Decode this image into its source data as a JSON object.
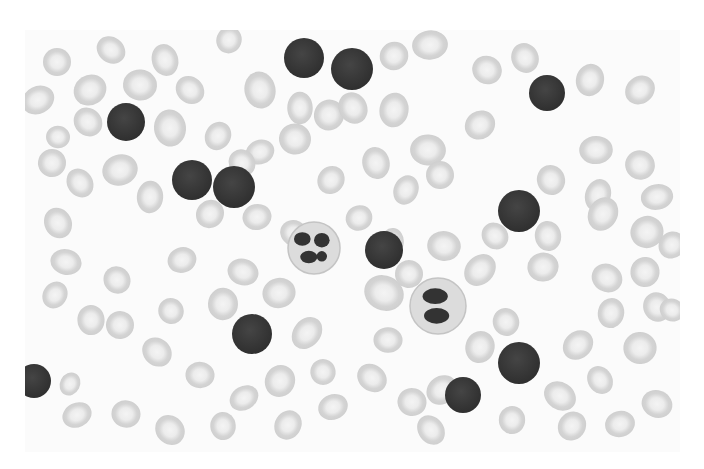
{
  "image": {
    "description": "Grayscale peripheral blood smear micrograph",
    "subject": "Blood cells: numerous small lymphocytes, two segmented neutrophils, and red blood cells",
    "field": {
      "x": 25,
      "y": 30,
      "width": 655,
      "height": 422
    },
    "colors": {
      "background": "#ffffff",
      "rbc_fill": "#d6d6d6",
      "rbc_center": "#f2f2f2",
      "lymphocyte": "#3a3a3a",
      "neutrophil_cytoplasm": "#e0e0e0",
      "neutrophil_nucleus": "#333333"
    },
    "lymphocytes": [
      {
        "cx": 304,
        "cy": 58,
        "r": 20
      },
      {
        "cx": 352,
        "cy": 69,
        "r": 21
      },
      {
        "cx": 126,
        "cy": 122,
        "r": 19
      },
      {
        "cx": 547,
        "cy": 93,
        "r": 18
      },
      {
        "cx": 192,
        "cy": 180,
        "r": 20
      },
      {
        "cx": 234,
        "cy": 187,
        "r": 21
      },
      {
        "cx": 519,
        "cy": 211,
        "r": 21
      },
      {
        "cx": 384,
        "cy": 250,
        "r": 19
      },
      {
        "cx": 252,
        "cy": 334,
        "r": 20
      },
      {
        "cx": 519,
        "cy": 363,
        "r": 21
      },
      {
        "cx": 463,
        "cy": 395,
        "r": 18
      },
      {
        "cx": 34,
        "cy": 381,
        "r": 17
      }
    ],
    "neutrophils": [
      {
        "cx": 314,
        "cy": 248,
        "r": 26
      },
      {
        "cx": 438,
        "cy": 306,
        "r": 28
      }
    ],
    "rbcs": [
      [
        57,
        62,
        14
      ],
      [
        111,
        50,
        14
      ],
      [
        165,
        60,
        14
      ],
      [
        229,
        40,
        13
      ],
      [
        90,
        90,
        15
      ],
      [
        140,
        85,
        17
      ],
      [
        190,
        90,
        14
      ],
      [
        260,
        90,
        16
      ],
      [
        329,
        115,
        15
      ],
      [
        38,
        100,
        15
      ],
      [
        58,
        137,
        12
      ],
      [
        88,
        122,
        14
      ],
      [
        170,
        128,
        16
      ],
      [
        218,
        136,
        14
      ],
      [
        260,
        152,
        13
      ],
      [
        295,
        139,
        16
      ],
      [
        242,
        163,
        13
      ],
      [
        300,
        108,
        14
      ],
      [
        331,
        180,
        14
      ],
      [
        120,
        170,
        16
      ],
      [
        52,
        163,
        14
      ],
      [
        80,
        183,
        14
      ],
      [
        150,
        197,
        14
      ],
      [
        210,
        214,
        14
      ],
      [
        257,
        217,
        13
      ],
      [
        294,
        233,
        14
      ],
      [
        353,
        108,
        15
      ],
      [
        394,
        110,
        15
      ],
      [
        394,
        56,
        14
      ],
      [
        430,
        45,
        16
      ],
      [
        487,
        70,
        15
      ],
      [
        525,
        58,
        14
      ],
      [
        590,
        80,
        14
      ],
      [
        640,
        90,
        15
      ],
      [
        596,
        150,
        15
      ],
      [
        640,
        165,
        15
      ],
      [
        551,
        180,
        14
      ],
      [
        598,
        195,
        14
      ],
      [
        480,
        125,
        15
      ],
      [
        428,
        150,
        16
      ],
      [
        440,
        175,
        14
      ],
      [
        376,
        163,
        15
      ],
      [
        406,
        190,
        13
      ],
      [
        359,
        218,
        13
      ],
      [
        444,
        246,
        15
      ],
      [
        495,
        236,
        14
      ],
      [
        548,
        236,
        14
      ],
      [
        603,
        214,
        15
      ],
      [
        647,
        232,
        16
      ],
      [
        66,
        262,
        14
      ],
      [
        117,
        280,
        14
      ],
      [
        91,
        320,
        14
      ],
      [
        55,
        295,
        12
      ],
      [
        182,
        260,
        14
      ],
      [
        243,
        272,
        14
      ],
      [
        171,
        311,
        13
      ],
      [
        223,
        304,
        15
      ],
      [
        307,
        333,
        15
      ],
      [
        279,
        293,
        16
      ],
      [
        384,
        293,
        18
      ],
      [
        409,
        274,
        14
      ],
      [
        392,
        242,
        13
      ],
      [
        480,
        270,
        15
      ],
      [
        543,
        267,
        15
      ],
      [
        607,
        278,
        14
      ],
      [
        657,
        307,
        15
      ],
      [
        611,
        313,
        14
      ],
      [
        578,
        345,
        14
      ],
      [
        640,
        348,
        16
      ],
      [
        560,
        396,
        15
      ],
      [
        506,
        322,
        14
      ],
      [
        480,
        347,
        15
      ],
      [
        442,
        390,
        14
      ],
      [
        388,
        340,
        14
      ],
      [
        372,
        378,
        14
      ],
      [
        323,
        372,
        13
      ],
      [
        280,
        381,
        15
      ],
      [
        244,
        398,
        13
      ],
      [
        200,
        375,
        14
      ],
      [
        157,
        352,
        14
      ],
      [
        120,
        325,
        14
      ],
      [
        70,
        384,
        11
      ],
      [
        77,
        415,
        13
      ],
      [
        126,
        414,
        14
      ],
      [
        170,
        430,
        14
      ],
      [
        223,
        426,
        14
      ],
      [
        288,
        425,
        14
      ],
      [
        333,
        407,
        13
      ],
      [
        412,
        402,
        14
      ],
      [
        431,
        430,
        14
      ],
      [
        512,
        420,
        14
      ],
      [
        572,
        426,
        14
      ],
      [
        620,
        424,
        13
      ],
      [
        657,
        404,
        15
      ],
      [
        600,
        380,
        13
      ],
      [
        645,
        272,
        15
      ],
      [
        672,
        245,
        13
      ],
      [
        657,
        197,
        14
      ],
      [
        672,
        310,
        12
      ],
      [
        58,
        223,
        14
      ]
    ]
  }
}
